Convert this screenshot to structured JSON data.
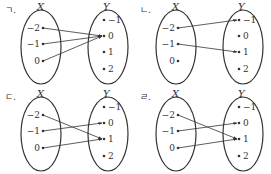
{
  "panels": [
    {
      "label": "ㄱ.",
      "domain_name": "X",
      "codomain_name": "Y",
      "domain": [
        "−2",
        "−1",
        "0"
      ],
      "codomain": [
        "−1",
        "0",
        "1",
        "2"
      ],
      "mapping": [
        [
          0,
          1
        ],
        [
          1,
          1
        ],
        [
          2,
          1
        ]
      ]
    },
    {
      "label": "ㄴ.",
      "domain_name": "X",
      "codomain_name": "Y",
      "domain": [
        "−2",
        "−1",
        "0"
      ],
      "codomain": [
        "−1",
        "0",
        "1",
        "2"
      ],
      "mapping": [
        [
          0,
          0
        ],
        [
          1,
          2
        ]
      ]
    },
    {
      "label": "ㄷ.",
      "domain_name": "X",
      "codomain_name": "Y",
      "domain": [
        "−2",
        "−1",
        "0"
      ],
      "codomain": [
        "−1",
        "0",
        "1",
        "2"
      ],
      "mapping": [
        [
          0,
          2
        ],
        [
          1,
          1
        ],
        [
          2,
          2
        ]
      ]
    },
    {
      "label": "ㄹ.",
      "domain_name": "X",
      "codomain_name": "Y",
      "domain": [
        "−2",
        "−1",
        "0"
      ],
      "codomain": [
        "−1",
        "0",
        "1",
        "2"
      ],
      "mapping": [
        [
          0,
          2
        ],
        [
          1,
          1
        ],
        [
          2,
          2
        ]
      ]
    }
  ],
  "colors": {
    "ink": "#333333",
    "background": "#ffffff"
  }
}
